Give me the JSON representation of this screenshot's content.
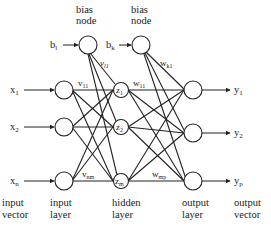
{
  "diagram": {
    "type": "feed-forward neural network",
    "bias_labels": {
      "hidden_bias_title_line1": "bias",
      "hidden_bias_title_line2": "node",
      "output_bias_title_line1": "bias",
      "output_bias_title_line2": "node",
      "hidden_bias_input": "b",
      "hidden_bias_input_sub": "l",
      "output_bias_input": "b",
      "output_bias_input_sub": "k"
    },
    "inputs": [
      {
        "base": "x",
        "sub": "1"
      },
      {
        "base": "x",
        "sub": "2"
      },
      {
        "base": "x",
        "sub": "n"
      }
    ],
    "hidden_nodes": [
      {
        "base": "z",
        "sub": "1"
      },
      {
        "base": "z",
        "sub": "2"
      },
      {
        "base": "z",
        "sub": "m"
      }
    ],
    "outputs": [
      {
        "base": "y",
        "sub": "1"
      },
      {
        "base": "y",
        "sub": "2"
      },
      {
        "base": "y",
        "sub": "p"
      }
    ],
    "weight_labels": {
      "v11": {
        "base": "v",
        "sub": "11"
      },
      "vl1": {
        "base": "v",
        "sub": "l1"
      },
      "vnm": {
        "base": "v",
        "sub": "nm"
      },
      "w11": {
        "base": "w",
        "sub": "11"
      },
      "wk1": {
        "base": "w",
        "sub": "k1"
      },
      "wmp": {
        "base": "w",
        "sub": "mp"
      }
    },
    "captions": {
      "input_vector": [
        "input",
        "vector"
      ],
      "input_layer": [
        "input",
        "layer"
      ],
      "hidden_layer": [
        "hidden",
        "layer"
      ],
      "output_layer": [
        "output",
        "layer"
      ],
      "output_vector": [
        "output",
        "vector"
      ]
    }
  }
}
